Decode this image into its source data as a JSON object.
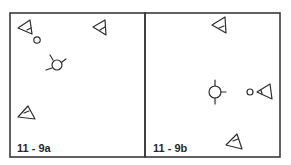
{
  "figure": {
    "panels": [
      {
        "id": "11-9a",
        "label": "11 - 9a",
        "symbols": [
          "triangle-pointing-left-with-circle",
          "triangle-pointing-left",
          "circle-with-spokes",
          "triangle-pointing-up"
        ]
      },
      {
        "id": "11-9b",
        "label": "11 - 9b",
        "symbols": [
          "triangle-pointing-left",
          "circle-with-spokes",
          "circle-with-triangle-pointing-left",
          "triangle-pointing-up"
        ]
      }
    ],
    "colors": {
      "stroke": "#2e2e2e",
      "background": "#ffffff"
    }
  }
}
